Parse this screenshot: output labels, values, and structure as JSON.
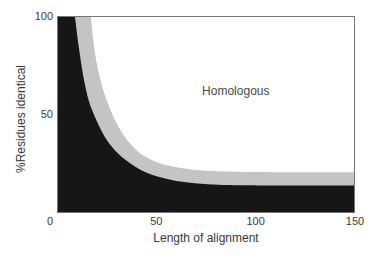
{
  "colors": {
    "background": "#ffffff",
    "non_homologous_fill": "#161616",
    "twilight_band_fill": "#c4c4c4",
    "plot_border": "#777777",
    "text": "#3b3b3b"
  },
  "chart_data": {
    "type": "area",
    "title": "",
    "xlabel": "Length of alignment",
    "ylabel": "%Residues identical",
    "xlim": [
      0,
      150
    ],
    "ylim": [
      0,
      100
    ],
    "grid": false,
    "legend": "none",
    "x_ticks": [
      {
        "value": 0,
        "label": "0"
      },
      {
        "value": 50,
        "label": "50"
      },
      {
        "value": 100,
        "label": "100"
      },
      {
        "value": 150,
        "label": "150"
      }
    ],
    "y_ticks": [
      {
        "value": 100,
        "label": "100"
      },
      {
        "value": 50,
        "label": "50"
      }
    ],
    "annotation": {
      "text": "Homologous",
      "x": 90,
      "y": 62
    },
    "regions": [
      {
        "name": "homologous",
        "fill": "#ffffff"
      },
      {
        "name": "twilight-band",
        "fill": "#c4c4c4",
        "upper_boundary": [
          [
            17,
            100
          ],
          [
            19,
            82
          ],
          [
            22,
            67
          ],
          [
            25.5,
            56
          ],
          [
            30,
            45.5
          ],
          [
            35,
            37.5
          ],
          [
            41,
            31
          ],
          [
            48,
            26.8
          ],
          [
            57,
            23.8
          ],
          [
            68,
            22
          ],
          [
            82,
            21.2
          ],
          [
            100,
            20.8
          ],
          [
            125,
            20.7
          ],
          [
            150,
            20.7
          ]
        ]
      },
      {
        "name": "non-homologous",
        "fill": "#161616",
        "upper_boundary": [
          [
            9,
            100
          ],
          [
            11,
            84
          ],
          [
            13.5,
            68
          ],
          [
            16,
            57
          ],
          [
            19,
            49
          ],
          [
            22.5,
            41.5
          ],
          [
            26.5,
            35
          ],
          [
            31.5,
            29.5
          ],
          [
            37.5,
            24.8
          ],
          [
            44,
            21
          ],
          [
            52,
            18.2
          ],
          [
            63,
            15.8
          ],
          [
            76,
            14.6
          ],
          [
            92,
            14.1
          ],
          [
            120,
            14
          ],
          [
            150,
            14
          ]
        ]
      }
    ]
  }
}
